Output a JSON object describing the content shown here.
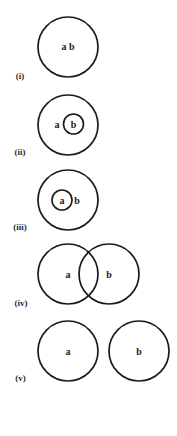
{
  "diagram": {
    "type": "set-relations-circles",
    "panels": [
      {
        "id": "i",
        "label": "(i)",
        "relation": "identical",
        "texts": {
          "ab": "a b"
        }
      },
      {
        "id": "ii",
        "label": "(ii)",
        "relation": "b-contained-in-a",
        "texts": {
          "a": "a",
          "b": "b"
        }
      },
      {
        "id": "iii",
        "label": "(iii)",
        "relation": "a-contained-in-b",
        "texts": {
          "a": "a",
          "b": "b"
        }
      },
      {
        "id": "iv",
        "label": "(iv)",
        "relation": "overlapping",
        "texts": {
          "a": "a",
          "b": "b"
        }
      },
      {
        "id": "v",
        "label": "(v)",
        "relation": "disjoint",
        "texts": {
          "a": "a",
          "b": "b"
        }
      }
    ],
    "colors": {
      "stroke": "#1a1a1a",
      "background": "#ffffff"
    }
  }
}
